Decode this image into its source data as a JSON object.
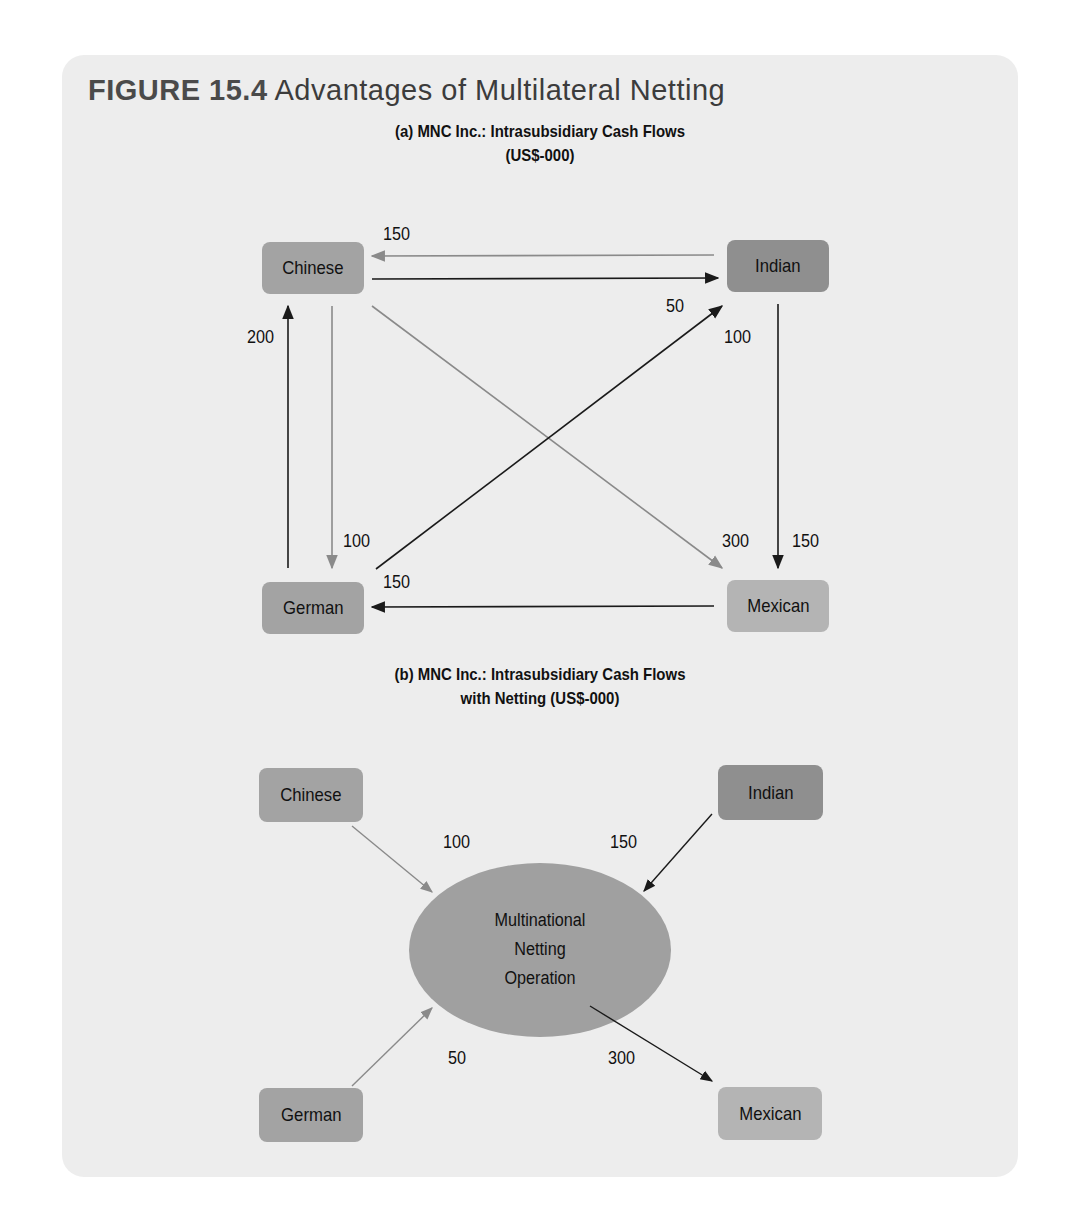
{
  "figure": {
    "number": "FIGURE 15.4",
    "title": "Advantages of Multilateral Netting"
  },
  "part_a": {
    "title_line1": "(a) MNC Inc.: Intrasubsidiary Cash Flows",
    "title_line2": "(US$-000)",
    "nodes": {
      "chinese": "Chinese",
      "indian": "Indian",
      "german": "German",
      "mexican": "Mexican"
    },
    "flows": [
      {
        "from": "Indian",
        "to": "Chinese",
        "value": "150"
      },
      {
        "from": "Chinese",
        "to": "Indian",
        "value": "50"
      },
      {
        "from": "German",
        "to": "Chinese",
        "value": "200"
      },
      {
        "from": "Chinese",
        "to": "German",
        "value": "100"
      },
      {
        "from": "Indian",
        "to": "Mexican",
        "value": "150"
      },
      {
        "from": "Mexican",
        "to": "German",
        "value": "150"
      },
      {
        "from": "Chinese",
        "to": "Mexican",
        "value": "300"
      },
      {
        "from": "German",
        "to": "Indian",
        "value": "100"
      }
    ]
  },
  "part_b": {
    "title_line1": "(b) MNC Inc.: Intrasubsidiary Cash Flows",
    "title_line2": "with Netting (US$-000)",
    "nodes": {
      "chinese": "Chinese",
      "indian": "Indian",
      "german": "German",
      "mexican": "Mexican"
    },
    "center": {
      "line1": "Multinational",
      "line2": "Netting",
      "line3": "Operation"
    },
    "flows": [
      {
        "from": "Chinese",
        "to": "Netting Center",
        "value": "100"
      },
      {
        "from": "Indian",
        "to": "Netting Center",
        "value": "150"
      },
      {
        "from": "German",
        "to": "Netting Center",
        "value": "50"
      },
      {
        "from": "Netting Center",
        "to": "Mexican",
        "value": "300"
      }
    ]
  },
  "colors": {
    "panel_bg": "#ededed",
    "box_chinese": "#a3a3a3",
    "box_indian": "#8f8f8f",
    "box_german": "#a3a3a3",
    "box_mexican": "#b4b4b4",
    "ellipse": "#a0a0a0",
    "arrow_dark": "#1a1a1a",
    "arrow_light": "#8a8a8a"
  }
}
